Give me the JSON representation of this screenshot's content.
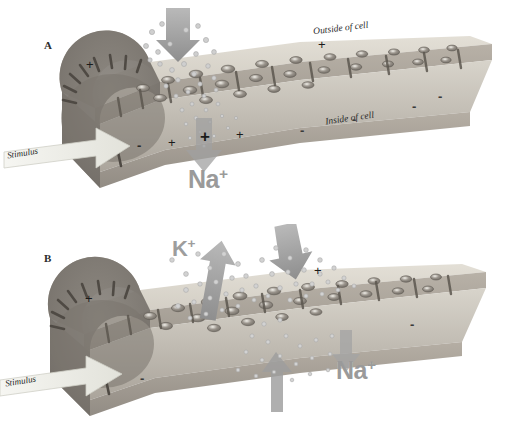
{
  "figure": {
    "background_color": "#ffffff",
    "membrane_top_color": "#d6d2c9",
    "membrane_side_color": "#b3aca2",
    "membrane_inner_color": "#8d8780",
    "arrow_gray": "#9b9b9b",
    "stimulus_arrow_color": "#efefe9",
    "ion_label_color": "#9a9a9a"
  },
  "panels": [
    {
      "id": "A",
      "letter": "A",
      "labels": {
        "outside": "Outside of cell",
        "inside": "Inside of cell",
        "stimulus": "Stimulus"
      },
      "ions": [
        {
          "name": "sodium",
          "text": "Na",
          "charge": "+",
          "direction": "influx"
        }
      ],
      "charges_outside": [
        "+",
        "+"
      ],
      "charges_inside": [
        "-",
        "+",
        "+",
        "+",
        "-",
        "-",
        "-",
        "-"
      ],
      "arrows": [
        {
          "name": "sodium-influx-arrow",
          "direction": "down"
        },
        {
          "name": "sodium-inward-arrow",
          "direction": "down"
        },
        {
          "name": "stimulus-arrow",
          "direction": "right"
        }
      ]
    },
    {
      "id": "B",
      "letter": "B",
      "labels": {
        "stimulus": "Stimulus"
      },
      "ions": [
        {
          "name": "potassium",
          "text": "K",
          "charge": "+",
          "direction": "efflux"
        },
        {
          "name": "sodium",
          "text": "Na",
          "charge": "+",
          "direction": "influx"
        }
      ],
      "charges_outside": [
        "+",
        "+"
      ],
      "charges_inside": [
        "-",
        "-"
      ],
      "arrows": [
        {
          "name": "potassium-efflux-arrow",
          "direction": "up"
        },
        {
          "name": "sodium-influx-arrow",
          "direction": "down"
        },
        {
          "name": "sodium-inward-arrow",
          "direction": "up"
        },
        {
          "name": "sodium-outward-arrow",
          "direction": "down-right"
        },
        {
          "name": "stimulus-arrow",
          "direction": "right"
        }
      ]
    }
  ]
}
